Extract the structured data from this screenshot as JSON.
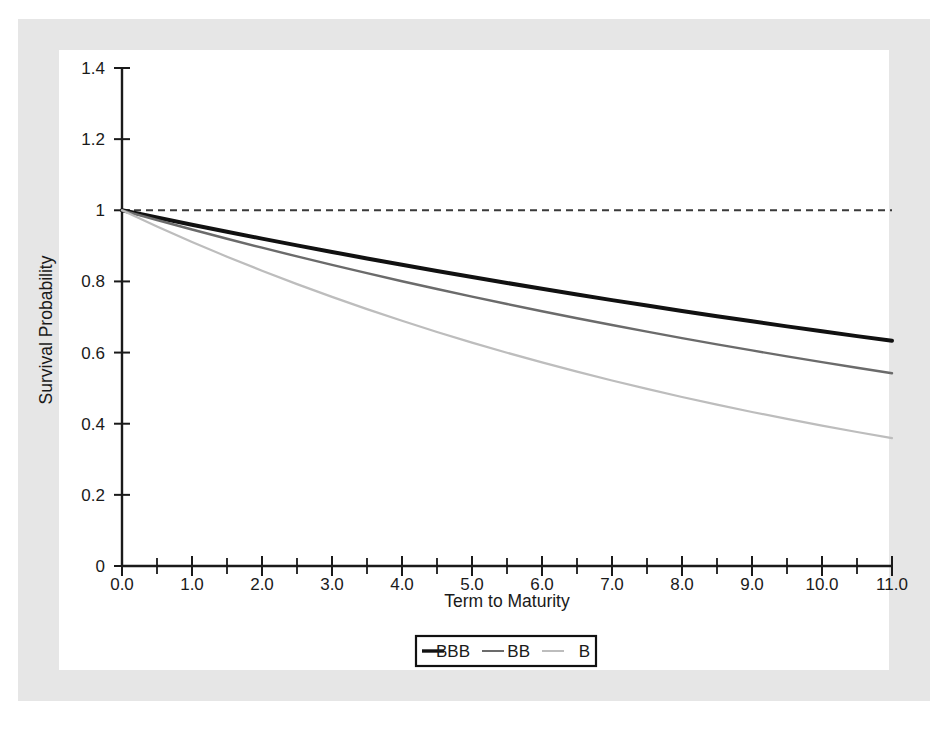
{
  "figure": {
    "background_color": "#ffffff",
    "border_color": "#e6e6e6"
  },
  "chart_data": {
    "type": "line",
    "title": "",
    "xlabel": "Term to Maturity",
    "ylabel": "Survival Probability",
    "xlim": [
      0.0,
      11.0
    ],
    "ylim": [
      0,
      1.4
    ],
    "grid": false,
    "legend_position": "bottom-center",
    "xticks": [
      "0.0",
      "1.0",
      "2.0",
      "3.0",
      "4.0",
      "5.0",
      "6.0",
      "7.0",
      "8.0",
      "9.0",
      "10.0",
      "11.0"
    ],
    "xtick_values": [
      0,
      1,
      2,
      3,
      4,
      5,
      6,
      7,
      8,
      9,
      10,
      11
    ],
    "xminor_step": 0.5,
    "yticks": [
      "0",
      "0.2",
      "0.4",
      "0.6",
      "0.8",
      "1",
      "1.2",
      "1.4"
    ],
    "ytick_values": [
      0,
      0.2,
      0.4,
      0.6,
      0.8,
      1.0,
      1.2,
      1.4
    ],
    "reference_line": {
      "label": "unit survival probability",
      "y": 1.0,
      "style": "dashed",
      "color": "#3a3a3a"
    },
    "x": [
      0,
      0.5,
      1,
      1.5,
      2,
      2.5,
      3,
      3.5,
      4,
      4.5,
      5,
      5.5,
      6,
      6.5,
      7,
      7.5,
      8,
      8.5,
      9,
      9.5,
      10,
      10.5,
      11
    ],
    "series": [
      {
        "name": "BBB",
        "color": "#111111",
        "width": 4.0,
        "values": [
          1.0,
          0.9795,
          0.9593,
          0.9397,
          0.9203,
          0.9014,
          0.8829,
          0.8647,
          0.8469,
          0.8295,
          0.8124,
          0.7957,
          0.7793,
          0.7633,
          0.7475,
          0.7321,
          0.7171,
          0.7023,
          0.6878,
          0.6737,
          0.6598,
          0.6462,
          0.633
        ]
      },
      {
        "name": "BB",
        "color": "#6b6b6b",
        "width": 2.4,
        "values": [
          1.0,
          0.9726,
          0.9459,
          0.92,
          0.8948,
          0.8703,
          0.8464,
          0.8232,
          0.8006,
          0.7786,
          0.7573,
          0.7365,
          0.7162,
          0.6966,
          0.6774,
          0.6588,
          0.6407,
          0.6231,
          0.606,
          0.5893,
          0.5731,
          0.5574,
          0.542
        ]
      },
      {
        "name": "B",
        "color": "#bdbdbd",
        "width": 2.2,
        "values": [
          1.0,
          0.9545,
          0.9111,
          0.8697,
          0.8302,
          0.7925,
          0.7565,
          0.7221,
          0.6893,
          0.658,
          0.6281,
          0.5996,
          0.5724,
          0.5464,
          0.5216,
          0.4979,
          0.4752,
          0.4537,
          0.433,
          0.4134,
          0.3946,
          0.3767,
          0.3595
        ]
      }
    ]
  },
  "legend": {
    "entries": [
      {
        "label": "BBB",
        "color": "#111111"
      },
      {
        "label": "BB",
        "color": "#6b6b6b"
      },
      {
        "label": "B",
        "color": "#bdbdbd"
      }
    ]
  }
}
